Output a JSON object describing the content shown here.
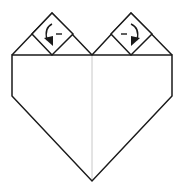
{
  "diagram": {
    "title": "Origami heart folding step",
    "type": "origami-diagram",
    "colors": {
      "stroke": "#1a1a1a",
      "center_crease": "#c8c8c8",
      "paper": "#ffffff"
    },
    "elements": [
      {
        "name": "heart-outline",
        "description": "Pentagon body with two triangular flaps on top"
      },
      {
        "name": "center-crease",
        "description": "Vertical valley crease down the middle"
      },
      {
        "name": "left-diamond-flap",
        "symbol": "fold-arrow-left",
        "label": "-"
      },
      {
        "name": "right-diamond-flap",
        "symbol": "fold-arrow-right",
        "label": "-"
      }
    ]
  }
}
